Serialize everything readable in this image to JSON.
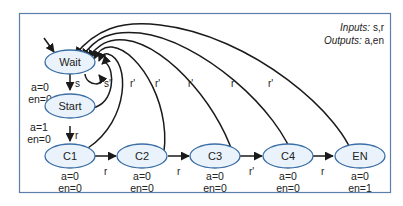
{
  "legend": {
    "inputs_key": "Inputs:",
    "inputs_value": " s,r",
    "outputs_key": "Outputs:",
    "outputs_value": " a,en"
  },
  "states": [
    {
      "id": "wait",
      "label": "Wait",
      "out1": "a=0",
      "out2": "en=0"
    },
    {
      "id": "start",
      "label": "Start",
      "out1": "a=1",
      "out2": "en=0"
    },
    {
      "id": "c1",
      "label": "C1",
      "out1": "a=0",
      "out2": "en=0"
    },
    {
      "id": "c2",
      "label": "C2",
      "out1": "a=0",
      "out2": "en=0"
    },
    {
      "id": "c3",
      "label": "C3",
      "out1": "a=0",
      "out2": "en=0"
    },
    {
      "id": "c4",
      "label": "C4",
      "out1": "a=0",
      "out2": "en=0"
    },
    {
      "id": "en",
      "label": "EN",
      "out1": "a=0",
      "out2": "en=1"
    }
  ],
  "transitions": [
    {
      "from": "wait",
      "to": "start",
      "label": "s"
    },
    {
      "from": "wait",
      "to": "wait",
      "label": "s'"
    },
    {
      "from": "start",
      "to": "c1",
      "label": "r"
    },
    {
      "from": "start",
      "to": "wait",
      "label": "r'"
    },
    {
      "from": "c1",
      "to": "c2",
      "label": "r"
    },
    {
      "from": "c1",
      "to": "wait",
      "label": "r'"
    },
    {
      "from": "c2",
      "to": "c3",
      "label": "r"
    },
    {
      "from": "c2",
      "to": "wait",
      "label": "r'"
    },
    {
      "from": "c3",
      "to": "c4",
      "label": "r'"
    },
    {
      "from": "c3",
      "to": "wait",
      "label": "r"
    },
    {
      "from": "c4",
      "to": "en",
      "label": "r"
    },
    {
      "from": "c4",
      "to": "wait",
      "label": "r'"
    },
    {
      "from": "en",
      "to": "wait",
      "label": ""
    }
  ],
  "colors": {
    "frame": "#5a7fa8",
    "state_fill": "#eaf3fb",
    "state_stroke": "#3b6fa5",
    "edge": "#1a1a1a"
  }
}
